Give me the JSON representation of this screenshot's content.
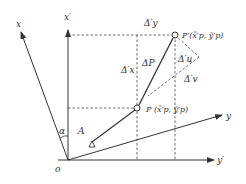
{
  "diagram": {
    "axes": {
      "x_prime": "x′",
      "y_prime": "y′",
      "x": "x",
      "y": "y",
      "origin": "o"
    },
    "angle_label": "α",
    "point_A": "A",
    "point_P": "P (x̃′p, ỹ′p)",
    "point_P_prime": "P′(x̃′p, ỹ′p)",
    "delta_P": "ΔP",
    "delta_y_prime": "Δ′y",
    "delta_x_prime": "Δ′x",
    "delta_u_prime": "Δ′u",
    "delta_v_prime": "Δ′v"
  }
}
